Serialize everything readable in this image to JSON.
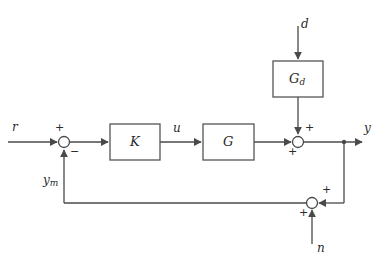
{
  "diagram": {
    "type": "control-block-diagram",
    "colors": {
      "background": "#ffffff",
      "line": "#4a4a4a",
      "block_stroke": "#555555",
      "block_fill": "#ffffff",
      "text": "#2b2b2b"
    },
    "blocks": [
      {
        "id": "K",
        "label": "K",
        "sub": "",
        "x": 110,
        "y": 124,
        "w": 50,
        "h": 36
      },
      {
        "id": "G",
        "label": "G",
        "sub": "",
        "x": 203,
        "y": 124,
        "w": 51,
        "h": 36
      },
      {
        "id": "Gd",
        "label": "G",
        "sub": "d",
        "x": 273,
        "y": 61,
        "w": 50,
        "h": 36
      }
    ],
    "junctions": [
      {
        "id": "sum-error",
        "cx": 64,
        "cy": 142,
        "r": 5.5
      },
      {
        "id": "sum-output",
        "cx": 298,
        "cy": 142,
        "r": 5.5
      },
      {
        "id": "sum-feedback",
        "cx": 312,
        "cy": 203,
        "r": 5.5
      }
    ],
    "branch_points": [
      {
        "id": "output-branch",
        "cx": 344,
        "cy": 142,
        "r": 2.2
      }
    ],
    "signal_labels": [
      {
        "id": "r",
        "text": "r",
        "sub": "",
        "x": 12,
        "y": 121
      },
      {
        "id": "u",
        "text": "u",
        "sub": "",
        "x": 173,
        "y": 122
      },
      {
        "id": "y",
        "text": "y",
        "sub": "",
        "x": 364,
        "y": 122
      },
      {
        "id": "d",
        "text": "d",
        "sub": "",
        "x": 301,
        "y": 18
      },
      {
        "id": "n",
        "text": "n",
        "sub": "",
        "x": 317,
        "y": 242
      },
      {
        "id": "ym",
        "text": "y",
        "sub": "m",
        "x": 43,
        "y": 174
      }
    ],
    "sign_labels": [
      {
        "id": "sum-error-plus",
        "text": "+",
        "x": 55,
        "y": 122
      },
      {
        "id": "sum-error-minus",
        "text": "−",
        "x": 70,
        "y": 146
      },
      {
        "id": "sum-output-plus-d",
        "text": "+",
        "x": 305,
        "y": 122
      },
      {
        "id": "sum-output-plus-g",
        "text": "+",
        "x": 288,
        "y": 146
      },
      {
        "id": "sum-feedback-plus-y",
        "text": "+",
        "x": 322,
        "y": 184
      },
      {
        "id": "sum-feedback-plus-n",
        "text": "+",
        "x": 299,
        "y": 207
      }
    ]
  }
}
